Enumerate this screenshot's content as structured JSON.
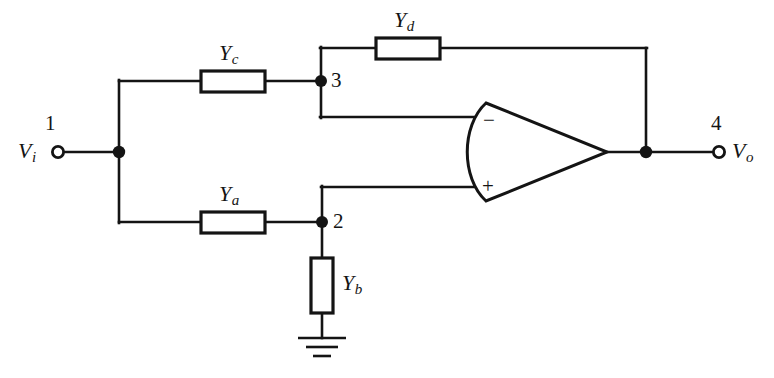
{
  "diagram": {
    "background_color": "#ffffff",
    "line_color": "#141414"
  },
  "terminals": [
    {
      "name": "input-terminal",
      "node_number": "1",
      "signal_label": "V",
      "signal_subscript": "i"
    },
    {
      "name": "output-terminal",
      "node_number": "4",
      "signal_label": "V",
      "signal_subscript": "o"
    }
  ],
  "nodes": [
    {
      "id": "node-1",
      "number": "1"
    },
    {
      "id": "node-2",
      "number": "2"
    },
    {
      "id": "node-3",
      "number": "3"
    },
    {
      "id": "node-4",
      "number": "4"
    }
  ],
  "components": [
    {
      "id": "Ya",
      "symbol": "Y",
      "subscript": "a",
      "kind": "admittance",
      "orientation": "horizontal"
    },
    {
      "id": "Yb",
      "symbol": "Y",
      "subscript": "b",
      "kind": "admittance",
      "orientation": "vertical"
    },
    {
      "id": "Yc",
      "symbol": "Y",
      "subscript": "c",
      "kind": "admittance",
      "orientation": "horizontal"
    },
    {
      "id": "Yd",
      "symbol": "Y",
      "subscript": "d",
      "kind": "admittance",
      "orientation": "horizontal"
    }
  ],
  "opamp": {
    "name": "operational-amplifier",
    "inverting_input_label": "−",
    "noninverting_input_label": "+"
  },
  "ground": {
    "name": "ground-symbol",
    "label": ""
  }
}
